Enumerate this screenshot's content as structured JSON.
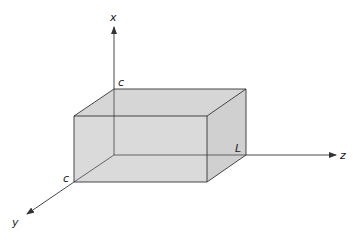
{
  "diagram": {
    "type": "3d-rectangular-box",
    "axes": [
      {
        "name": "x",
        "label": "x",
        "direction": "up"
      },
      {
        "name": "y",
        "label": "y",
        "direction": "down-left"
      },
      {
        "name": "z",
        "label": "z",
        "direction": "right"
      }
    ],
    "dimension_labels": [
      {
        "id": "height",
        "label": "c",
        "along": "x"
      },
      {
        "id": "depth",
        "label": "c",
        "along": "y"
      },
      {
        "id": "length",
        "label": "L",
        "along": "z"
      }
    ],
    "colors": {
      "box_fill": "#d9d9d9",
      "edge": "#333333",
      "axis": "#333333",
      "background": "#ffffff"
    }
  }
}
